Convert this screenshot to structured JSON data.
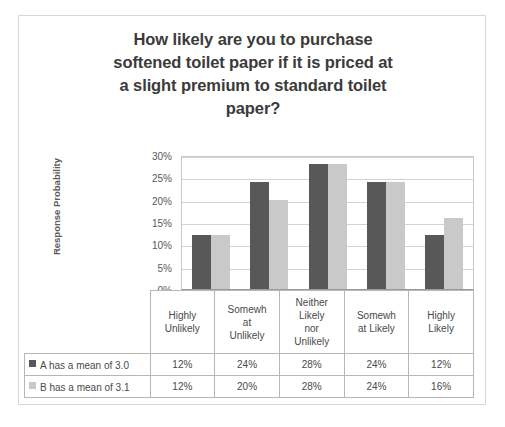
{
  "chart_data": {
    "type": "bar",
    "title_lines": [
      "How likely are you to purchase",
      "softened toilet paper if it is priced at",
      "a slight premium to standard toilet",
      "paper?"
    ],
    "xlabel": "",
    "ylabel": "Response Probability",
    "ylim": [
      0,
      30
    ],
    "ytick_labels": [
      "0%",
      "5%",
      "10%",
      "15%",
      "20%",
      "25%",
      "30%"
    ],
    "ytick_values": [
      0,
      5,
      10,
      15,
      20,
      25,
      30
    ],
    "grid": true,
    "legend_position": "data-table",
    "categories": [
      "Highly Unlikely",
      "Somewhat Unlikely",
      "Neither Likely nor Unlikely",
      "Somewhat Likely",
      "Highly Likely"
    ],
    "category_display_lines": [
      [
        "Highly",
        "Unlikely"
      ],
      [
        "Somewh",
        "at",
        "Unlikely"
      ],
      [
        "Neither",
        "Likely",
        "nor",
        "Unlikely"
      ],
      [
        "Somewh",
        "at Likely"
      ],
      [
        "Highly",
        "Likely"
      ]
    ],
    "series": [
      {
        "name": "A has a mean of 3.0",
        "color": "#585858",
        "values": [
          12,
          24,
          28,
          24,
          12
        ],
        "labels": [
          "12%",
          "24%",
          "28%",
          "24%",
          "12%"
        ]
      },
      {
        "name": "B has a mean of 3.1",
        "color": "#c9c9c9",
        "values": [
          12,
          20,
          28,
          24,
          16
        ],
        "labels": [
          "12%",
          "20%",
          "28%",
          "24%",
          "16%"
        ]
      }
    ]
  },
  "colors": {
    "series_a": "#585858",
    "series_b": "#c9c9c9",
    "title_text": "#3b3b3b",
    "axis_text": "#595959",
    "gridline": "#d3d3d3",
    "table_border": "#b7b7b7",
    "frame_border": "#d8d8d8"
  }
}
